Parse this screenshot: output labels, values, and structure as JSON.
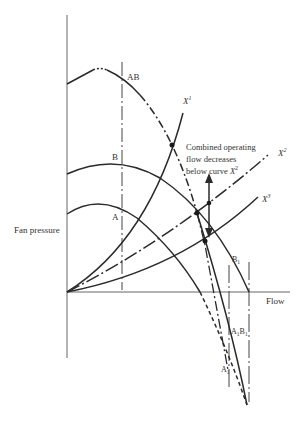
{
  "diagram": {
    "axes": {
      "y_label": "Fan pressure",
      "x_label": "Flow"
    },
    "curve_labels": {
      "ab": "AB",
      "b": "B",
      "a": "A",
      "x1": "X",
      "x1_sup": "1",
      "x2": "X",
      "x2_sup": "2",
      "x3": "X",
      "x3_sup": "3",
      "b1": "B",
      "b1_sub": "1",
      "a1b1_a": "A",
      "a1b1_a_sub": "1",
      "a1b1_b": "B",
      "a1b1_b_sub": "1",
      "a1": "A",
      "a1_sub": "1"
    },
    "annotation": {
      "line1": "Combined operating",
      "line2": "flow decreases",
      "line3_prefix": "below curve ",
      "line3_var": "X",
      "line3_sup": "2"
    },
    "colors": {
      "line": "#2a2a2a",
      "axis": "#555555",
      "text": "#333333"
    }
  }
}
